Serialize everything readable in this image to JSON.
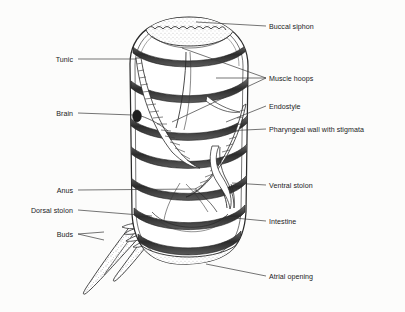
{
  "diagram": {
    "style": {
      "ink": "#1b1b1b",
      "line": "#2a2a2a",
      "fill": "#ffffff",
      "background": "#fcfcfb",
      "muscle_band": "#3a3a3a",
      "stipple": "#555555"
    },
    "labels_right": [
      {
        "id": "buccal-siphon",
        "text": "Buccal siphon",
        "y": 28,
        "leader_from_x": 266,
        "leader_to_x": 196,
        "leader_to_y": 22,
        "kind": "single"
      },
      {
        "id": "muscle-hoops",
        "text": "Muscle hoops",
        "y": 80,
        "leader_from_x": 266,
        "leader_to_x": 170,
        "leader_to_y": 44,
        "kind": "fork"
      },
      {
        "id": "endostyle",
        "text": "Endostyle",
        "y": 108,
        "leader_from_x": 266,
        "leader_to_x": 172,
        "leader_to_y": 122,
        "kind": "single"
      },
      {
        "id": "pharyngeal-wall",
        "text": "Pharyngeal wall with stigmata",
        "y": 131,
        "leader_from_x": 266,
        "leader_to_x": 225,
        "leader_to_y": 131,
        "kind": "single"
      },
      {
        "id": "ventral-stolon",
        "text": "Ventral stolon",
        "y": 187,
        "leader_from_x": 266,
        "leader_to_x": 231,
        "leader_to_y": 184,
        "kind": "single"
      },
      {
        "id": "intestine",
        "text": "Intestine",
        "y": 223,
        "leader_from_x": 266,
        "leader_to_x": 224,
        "leader_to_y": 218,
        "kind": "single"
      },
      {
        "id": "atrial-opening",
        "text": "Atrial opening",
        "y": 278,
        "leader_from_x": 266,
        "leader_to_x": 206,
        "leader_to_y": 265,
        "kind": "single"
      }
    ],
    "labels_left": [
      {
        "id": "tunic",
        "text": "Tunic",
        "y": 61,
        "leader_from_x": 80,
        "leader_to_x": 135,
        "leader_to_y": 61,
        "kind": "single"
      },
      {
        "id": "brain",
        "text": "Brain",
        "y": 115,
        "leader_from_x": 80,
        "leader_to_x": 133,
        "leader_to_y": 116,
        "kind": "single"
      },
      {
        "id": "anus",
        "text": "Anus",
        "y": 192,
        "leader_from_x": 80,
        "leader_to_x": 196,
        "leader_to_y": 190,
        "kind": "single"
      },
      {
        "id": "dorsal-stolon",
        "text": "Dorsal stolon",
        "y": 212,
        "leader_from_x": 80,
        "leader_to_x": 150,
        "leader_to_y": 216,
        "kind": "single"
      },
      {
        "id": "buds",
        "text": "Buds",
        "y": 236,
        "leader_from_x": 80,
        "leader_to_x": 103,
        "leader_to_y": 236,
        "kind": "fork"
      }
    ],
    "structures": [
      {
        "id": "tunic-body",
        "name": "tunic-outer-wall",
        "count": 1
      },
      {
        "id": "muscle-hoop-band",
        "name": "muscle-hoop",
        "count": 7
      },
      {
        "id": "stigmata-rows",
        "name": "stigmata-row",
        "count": 2
      },
      {
        "id": "stolon",
        "name": "dorsal-stolon",
        "count": 1
      },
      {
        "id": "bud-cluster",
        "name": "bud",
        "count": 4
      }
    ]
  }
}
